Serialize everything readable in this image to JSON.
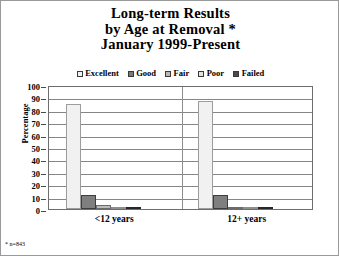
{
  "chart_data": {
    "type": "bar",
    "title": "Long-term Results by Age at Removal * January 1999-Present",
    "title_lines": [
      "Long-term Results",
      "by Age at Removal *",
      "January 1999-Present"
    ],
    "categories": [
      "<12 years",
      "12+ years"
    ],
    "series": [
      {
        "name": "Excellent",
        "values": [
          85,
          87
        ],
        "color": "#f1f1f1"
      },
      {
        "name": "Good",
        "values": [
          11,
          11
        ],
        "color": "#7f7f7f"
      },
      {
        "name": "Fair",
        "values": [
          3,
          0.6
        ],
        "color": "#bcbcbc"
      },
      {
        "name": "Poor",
        "values": [
          1,
          0.6
        ],
        "color": "#e4e4e4"
      },
      {
        "name": "Failed",
        "values": [
          0.6,
          0.6
        ],
        "color": "#4f4f4f"
      }
    ],
    "xlabel": "",
    "ylabel": "Percentage",
    "ylim": [
      0,
      100
    ],
    "yticks": [
      0,
      10,
      20,
      30,
      40,
      50,
      60,
      70,
      80,
      90,
      100
    ],
    "ytick_labels": [
      "0",
      "10",
      "20",
      "30",
      "40",
      "50",
      "60",
      "70",
      "80",
      "90",
      "100"
    ],
    "grid": true,
    "legend_position": "top",
    "footnote": "* n=843"
  },
  "legend": {
    "items": [
      {
        "label": "Excellent",
        "swatch": "excellent"
      },
      {
        "label": "Good",
        "swatch": "good"
      },
      {
        "label": "Fair",
        "swatch": "fair"
      },
      {
        "label": "Poor",
        "swatch": "poor"
      },
      {
        "label": "Failed",
        "swatch": "failed"
      }
    ]
  }
}
